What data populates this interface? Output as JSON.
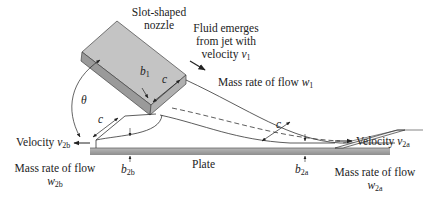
{
  "figure": {
    "nozzle_label": [
      "Slot-shaped",
      "nozzle"
    ],
    "jet_label": [
      "Fluid emerges",
      "from jet with",
      "velocity"
    ],
    "jet_velocity_symbol": "v",
    "jet_velocity_sub": "1",
    "mass_flow_1_text": "Mass rate of flow ",
    "mass_flow_1_symbol": "w",
    "mass_flow_1_sub": "1",
    "velocity_2a_text": "Velocity ",
    "velocity_2a_symbol": "v",
    "velocity_2a_sub": "2a",
    "velocity_2b_text": "Velocity ",
    "velocity_2b_symbol": "v",
    "velocity_2b_sub": "2b",
    "mass_flow_2b_text": "Mass rate of flow",
    "mass_flow_2b_symbol": "w",
    "mass_flow_2b_sub": "2b",
    "mass_flow_2a_text": "Mass rate of flow",
    "mass_flow_2a_symbol": "w",
    "mass_flow_2a_sub": "2a",
    "plate_label": "Plate",
    "b1_symbol": "b",
    "b1_sub": "1",
    "b2b_symbol": "b",
    "b2b_sub": "2b",
    "b2a_symbol": "b",
    "b2a_sub": "2a",
    "c_symbol": "c",
    "theta_symbol": "θ"
  }
}
